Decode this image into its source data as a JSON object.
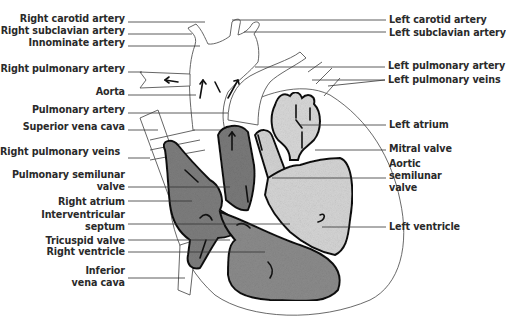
{
  "diagram": {
    "left_labels": [
      {
        "id": "right-carotid-artery",
        "text": "Right carotid artery",
        "x": 125,
        "y": 17
      },
      {
        "id": "right-subclavian-artery",
        "text": "Right subclavian artery",
        "x": 125,
        "y": 29
      },
      {
        "id": "innominate-artery",
        "text": "Innominate artery",
        "x": 125,
        "y": 41
      },
      {
        "id": "right-pulmonary-artery",
        "text": "Right pulmonary artery",
        "x": 125,
        "y": 67
      },
      {
        "id": "aorta",
        "text": "Aorta",
        "x": 125,
        "y": 90
      },
      {
        "id": "pulmonary-artery",
        "text": "Pulmonary artery",
        "x": 125,
        "y": 108
      },
      {
        "id": "superior-vena-cava",
        "text": "Superior vena cava",
        "x": 125,
        "y": 125
      },
      {
        "id": "right-pulmonary-veins",
        "text": "Right pulmonary veins",
        "x": 120,
        "y": 147
      },
      {
        "id": "pulmonary-semilunar-valve-1",
        "text": "Pulmonary semilunar",
        "x": 125,
        "y": 171
      },
      {
        "id": "pulmonary-semilunar-valve-2",
        "text": "valve",
        "x": 125,
        "y": 183
      },
      {
        "id": "right-atrium",
        "text": "Right atrium",
        "x": 125,
        "y": 196
      },
      {
        "id": "interventricular-septum-1",
        "text": "Interventricular",
        "x": 125,
        "y": 210
      },
      {
        "id": "interventricular-septum-2",
        "text": "septum",
        "x": 125,
        "y": 222
      },
      {
        "id": "tricuspid-valve",
        "text": "Tricuspid valve",
        "x": 125,
        "y": 235
      },
      {
        "id": "right-ventricle",
        "text": "Right ventricle",
        "x": 125,
        "y": 246
      },
      {
        "id": "inferior-vena-cava-1",
        "text": "Inferior",
        "x": 125,
        "y": 266
      },
      {
        "id": "inferior-vena-cava-2",
        "text": "vena cava",
        "x": 125,
        "y": 278
      }
    ],
    "right_labels": [
      {
        "id": "left-carotid-artery",
        "text": "Left carotid artery",
        "x": 389,
        "y": 14
      },
      {
        "id": "left-subclavian-artery",
        "text": "Left subclavian artery",
        "x": 389,
        "y": 27
      },
      {
        "id": "left-pulmonary-artery",
        "text": "Left pulmonary artery",
        "x": 388,
        "y": 60
      },
      {
        "id": "left-pulmonary-veins",
        "text": "Left pulmonary veins",
        "x": 388,
        "y": 74
      },
      {
        "id": "left-atrium",
        "text": "Left atrium",
        "x": 389,
        "y": 119
      },
      {
        "id": "mitral-valve",
        "text": "Mitral valve",
        "x": 389,
        "y": 143
      },
      {
        "id": "aortic-semilunar-valve-1",
        "text": "Aortic",
        "x": 389,
        "y": 158
      },
      {
        "id": "aortic-semilunar-valve-2",
        "text": "semilunar",
        "x": 389,
        "y": 170
      },
      {
        "id": "aortic-semilunar-valve-3",
        "text": "valve",
        "x": 389,
        "y": 182
      },
      {
        "id": "left-ventricle",
        "text": "Left ventricle",
        "x": 389,
        "y": 221
      }
    ],
    "colors": {
      "deoxygenated_fill": "#8a8a8a",
      "oxygenated_fill": "#d8d8d8",
      "outline": "#1a1a1a",
      "leader_line": "#333333"
    }
  }
}
